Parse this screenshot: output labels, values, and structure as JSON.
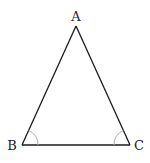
{
  "diagram": {
    "type": "isosceles-triangle",
    "vertices": [
      {
        "label": "A",
        "x": 76,
        "y": 26,
        "label_x": 76,
        "label_y": 21
      },
      {
        "label": "B",
        "x": 22,
        "y": 145,
        "label_x": 12,
        "label_y": 150
      },
      {
        "label": "C",
        "x": 130,
        "y": 145,
        "label_x": 139,
        "label_y": 150
      }
    ],
    "angle_marks": [
      {
        "at": "B",
        "style": "single-arc"
      },
      {
        "at": "C",
        "style": "single-arc"
      }
    ],
    "colors": {
      "line": "#1a1a1a",
      "arc": "#b0b0b0",
      "label": "#222222",
      "background": "#ffffff"
    }
  }
}
